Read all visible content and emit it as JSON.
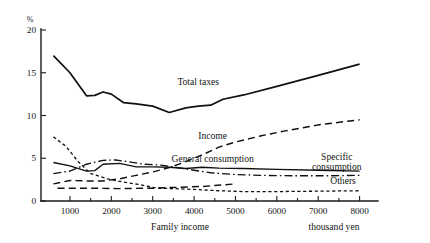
{
  "chart_data": {
    "type": "line",
    "title": "",
    "xlabel": "Family income",
    "xunit": "thousand yen",
    "ylabel": "%",
    "xlim": [
      300,
      8300
    ],
    "ylim": [
      0,
      20
    ],
    "grid": false,
    "legend": "inline-annotations",
    "x_ticks": [
      1000,
      2000,
      3000,
      4000,
      5000,
      6000,
      7000,
      8000
    ],
    "x_tick_labels": [
      "1000",
      "2000",
      "3000",
      "4000",
      "5000",
      "6000",
      "7000",
      "8000"
    ],
    "y_ticks": [
      0,
      5,
      10,
      15,
      20
    ],
    "y_tick_labels": [
      "0",
      "5",
      "10",
      "15",
      "20"
    ],
    "series": [
      {
        "name": "Total taxes",
        "style": "solid",
        "label_x": 4100,
        "label_y": 13.6,
        "x": [
          600,
          1000,
          1400,
          1600,
          1800,
          2000,
          2300,
          2600,
          3000,
          3400,
          3800,
          4100,
          4400,
          4700,
          5200,
          6000,
          7000,
          8000
        ],
        "values": [
          17.0,
          15.0,
          12.3,
          12.35,
          12.75,
          12.5,
          11.5,
          11.35,
          11.1,
          10.35,
          10.9,
          11.1,
          11.2,
          11.9,
          12.4,
          13.4,
          14.7,
          16.0
        ]
      },
      {
        "name": "Income",
        "style": "long-dash",
        "label_x": 4450,
        "label_y": 7.3,
        "x": [
          600,
          1000,
          1400,
          1800,
          2200,
          2600,
          3000,
          3400,
          3800,
          4200,
          4600,
          5000,
          5600,
          6200,
          7000,
          8000
        ],
        "values": [
          2.0,
          2.4,
          2.35,
          2.35,
          2.6,
          3.0,
          3.4,
          3.9,
          4.6,
          5.4,
          6.3,
          6.9,
          7.6,
          8.2,
          8.9,
          9.5
        ]
      },
      {
        "name": "General consumption",
        "style": "solid",
        "label_x": 4450,
        "label_y": 4.55,
        "x": [
          600,
          1000,
          1400,
          1600,
          1800,
          2200,
          2600,
          3000,
          3400,
          3800,
          4200,
          4600,
          5200,
          6000,
          7000,
          8000
        ],
        "values": [
          4.5,
          4.1,
          3.5,
          3.55,
          4.3,
          4.4,
          4.0,
          4.0,
          3.95,
          3.8,
          3.95,
          3.85,
          3.8,
          3.7,
          3.6,
          3.5
        ]
      },
      {
        "name": "Specific consumption",
        "style": "dash-dot",
        "label_x": 7450,
        "label_y": 4.5,
        "x": [
          600,
          1000,
          1400,
          1800,
          2100,
          2400,
          2800,
          3200,
          3600,
          4000,
          4400,
          5000,
          5600,
          6400,
          7200,
          8000
        ],
        "values": [
          3.2,
          3.5,
          4.3,
          4.75,
          4.8,
          4.6,
          4.3,
          4.2,
          3.9,
          3.6,
          3.3,
          3.1,
          3.0,
          2.95,
          2.95,
          3.0
        ]
      },
      {
        "name": "Others",
        "style": "short-dash",
        "label_x": 7600,
        "label_y": 1.9,
        "x": [
          600,
          900,
          1200,
          1500,
          1900,
          2300,
          2700,
          3100,
          3500,
          4000,
          4600,
          5200,
          6000,
          7000,
          8000
        ],
        "values": [
          7.5,
          6.4,
          4.6,
          3.2,
          2.6,
          2.2,
          1.9,
          1.5,
          1.45,
          1.35,
          1.2,
          1.1,
          1.1,
          1.15,
          1.2
        ]
      },
      {
        "name": "Others-baseline",
        "style": "long-dash",
        "label_x": null,
        "label_y": null,
        "x": [
          700,
          1400,
          2200,
          3000,
          3600,
          4200,
          5000
        ],
        "values": [
          1.5,
          1.5,
          1.45,
          1.5,
          1.6,
          1.7,
          2.0
        ]
      }
    ],
    "annotations": [
      {
        "text": "Total taxes",
        "x": 4100,
        "y": 13.6
      },
      {
        "text": "Income",
        "x": 4450,
        "y": 7.3
      },
      {
        "text": "General consumption",
        "x": 4450,
        "y": 4.55
      },
      {
        "text": "Specific",
        "x": 7450,
        "y": 4.75
      },
      {
        "text": "consumption",
        "x": 7450,
        "y": 3.6
      },
      {
        "text": "Others",
        "x": 7600,
        "y": 1.95
      }
    ]
  },
  "colors": {
    "ink": "#111111",
    "background": "#ffffff"
  }
}
